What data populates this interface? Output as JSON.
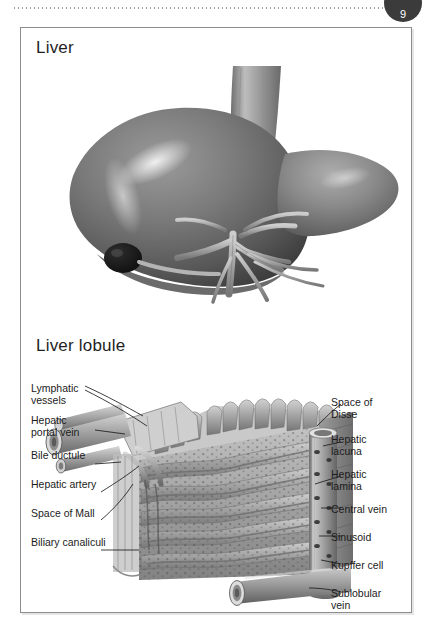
{
  "page": {
    "number": "9",
    "bleed_through_text": "Digestive System"
  },
  "panel": {
    "sections": [
      {
        "id": "liver",
        "heading": "Liver"
      },
      {
        "id": "liver-lobule",
        "heading": "Liver lobule"
      }
    ]
  },
  "figures": {
    "gross_liver": {
      "name": "liver-gross-anatomy-illustration",
      "description": "Shaded grayscale anatomical illustration of the liver with inferior vena cava, gallbladder and hepatic vessels at the porta hepatis"
    },
    "lobule_block": {
      "name": "liver-lobule-block-diagram",
      "description": "Cutaway three-dimensional block of a hepatic lobule showing hepatic laminae, sinusoids, a perforated central vein and the sublobular vein"
    }
  },
  "labels": {
    "left": [
      {
        "id": "lymphatic-vessels",
        "text": "Lymphatic\nvessels"
      },
      {
        "id": "hepatic-portal-vein",
        "text": "Hepatic\nportal vein"
      },
      {
        "id": "bile-ductule",
        "text": "Bile ductule"
      },
      {
        "id": "hepatic-artery",
        "text": "Hepatic artery"
      },
      {
        "id": "space-of-mall",
        "text": "Space of Mall"
      },
      {
        "id": "biliary-canaliculi",
        "text": "Biliary canaliculi"
      }
    ],
    "right": [
      {
        "id": "space-of-disse",
        "text": "Space of\nDisse"
      },
      {
        "id": "hepatic-lacuna",
        "text": "Hepatic\nlacuna"
      },
      {
        "id": "hepatic-lamina",
        "text": "Hepatic\nlamina"
      },
      {
        "id": "central-vein",
        "text": "Central vein"
      },
      {
        "id": "sinusoid",
        "text": "Sinusoid"
      },
      {
        "id": "kupffer-cell",
        "text": "Kupffer cell"
      },
      {
        "id": "sublobular-vein",
        "text": "Sublobular\nvein"
      }
    ]
  },
  "colors": {
    "page_background": "#ffffff",
    "frame_border": "#8d8d8d",
    "text": "#1c1c1c",
    "badge_fill": "#3b3b3b",
    "tissue_mid": "#8f8f8f",
    "tissue_dark": "#4a4a4a",
    "tissue_light": "#c9c9c9",
    "leader_line": "#1c1c1c"
  }
}
